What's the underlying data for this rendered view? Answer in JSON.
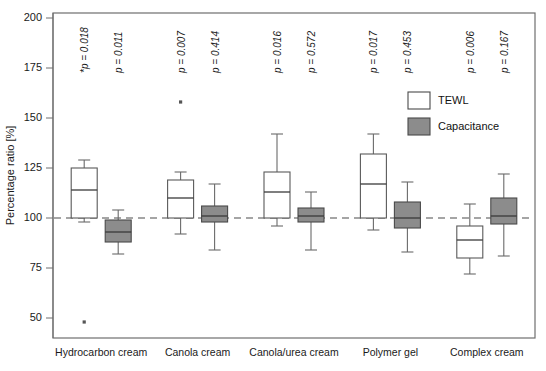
{
  "chart_data": {
    "type": "box",
    "title": "",
    "xlabel": "",
    "ylabel": "Percentage ratio [%]",
    "ylim": [
      40,
      205
    ],
    "yticks": [
      50,
      75,
      100,
      125,
      150,
      175,
      200
    ],
    "ytick_labels": [
      "50",
      "75",
      "100",
      "125",
      "150",
      "175",
      "200"
    ],
    "grid": false,
    "reference_line": 100,
    "legend_position": "top-right",
    "categories": [
      "Hydrocarbon cream",
      "Canola cream",
      "Canola/urea cream",
      "Polymer gel",
      "Complex cream"
    ],
    "legend": [
      {
        "name": "TEWL",
        "fill": "#ffffff"
      },
      {
        "name": "Capacitance",
        "fill": "#8c8c8c"
      }
    ],
    "series": [
      {
        "name": "TEWL",
        "fill": "#ffffff",
        "boxes": [
          {
            "category": "Hydrocarbon cream",
            "whisker_low": 98,
            "q1": 100,
            "median": 114,
            "q3": 125,
            "whisker_high": 129,
            "outliers": [
              48
            ],
            "p_value_label": "p = 0.018",
            "p_value": 0.018,
            "significant": true
          },
          {
            "category": "Canola cream",
            "whisker_low": 92,
            "q1": 100,
            "median": 110,
            "q3": 119,
            "whisker_high": 123,
            "outliers": [
              158
            ],
            "p_value_label": "p = 0.007",
            "p_value": 0.007,
            "significant": false
          },
          {
            "category": "Canola/urea cream",
            "whisker_low": 96,
            "q1": 100,
            "median": 113,
            "q3": 123,
            "whisker_high": 142,
            "outliers": [],
            "p_value_label": "p = 0.016",
            "p_value": 0.016,
            "significant": false
          },
          {
            "category": "Polymer gel",
            "whisker_low": 94,
            "q1": 100,
            "median": 117,
            "q3": 132,
            "whisker_high": 142,
            "outliers": [],
            "p_value_label": "p = 0.017",
            "p_value": 0.017,
            "significant": false
          },
          {
            "category": "Complex cream",
            "whisker_low": 72,
            "q1": 80,
            "median": 89,
            "q3": 96,
            "whisker_high": 107,
            "outliers": [],
            "p_value_label": "p = 0.006",
            "p_value": 0.006,
            "significant": false
          }
        ]
      },
      {
        "name": "Capacitance",
        "fill": "#8c8c8c",
        "boxes": [
          {
            "category": "Hydrocarbon cream",
            "whisker_low": 82,
            "q1": 88,
            "median": 93,
            "q3": 99,
            "whisker_high": 104,
            "outliers": [],
            "p_value_label": "p = 0.011",
            "p_value": 0.011,
            "significant": false
          },
          {
            "category": "Canola cream",
            "whisker_low": 84,
            "q1": 98,
            "median": 101,
            "q3": 106,
            "whisker_high": 117,
            "outliers": [],
            "p_value_label": "p = 0.414",
            "p_value": 0.414,
            "significant": false
          },
          {
            "category": "Canola/urea cream",
            "whisker_low": 84,
            "q1": 98,
            "median": 101,
            "q3": 105,
            "whisker_high": 113,
            "outliers": [],
            "p_value_label": "p = 0.572",
            "p_value": 0.572,
            "significant": false
          },
          {
            "category": "Polymer gel",
            "whisker_low": 83,
            "q1": 95,
            "median": 100,
            "q3": 108,
            "whisker_high": 118,
            "outliers": [],
            "p_value_label": "p = 0.453",
            "p_value": 0.453,
            "significant": false
          },
          {
            "category": "Complex cream",
            "whisker_low": 81,
            "q1": 97,
            "median": 101,
            "q3": 110,
            "whisker_high": 122,
            "outliers": [],
            "p_value_label": "p = 0.167",
            "p_value": 0.167,
            "significant": false
          }
        ]
      }
    ]
  }
}
